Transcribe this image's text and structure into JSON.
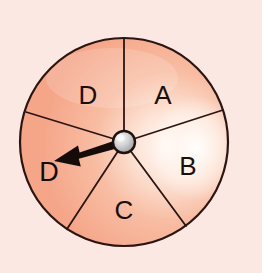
{
  "figure": {
    "kind": "spinner-wheel",
    "canvas": {
      "width": 262,
      "height": 273
    },
    "background_color": "#fbe8e2"
  },
  "wheel": {
    "center_x": 124,
    "center_y": 142,
    "radius": 104,
    "outline_color": "#2b1512",
    "outline_width": 2.2,
    "sector_fill": "#f7ae90",
    "sector_fill_light": "#fbd0bd",
    "highlight_color": "#fffaf6",
    "sector_count": 5,
    "spoke_color": "#2b1512",
    "spoke_width": 1.8,
    "sectors": [
      {
        "label": "A",
        "start_deg": -90,
        "end_deg": -18,
        "label_x": 163,
        "label_y": 97
      },
      {
        "label": "B",
        "start_deg": -18,
        "end_deg": 56,
        "label_x": 188,
        "label_y": 168
      },
      {
        "label": "C",
        "start_deg": 56,
        "end_deg": 124,
        "label_x": 124,
        "label_y": 212
      },
      {
        "label": "D",
        "start_deg": 124,
        "end_deg": 198,
        "label_x": 62,
        "label_y": 170
      },
      {
        "label": "D",
        "start_deg": 198,
        "end_deg": 270,
        "label_x": 88,
        "label_y": 97
      }
    ]
  },
  "hub": {
    "center_x": 124,
    "center_y": 142,
    "radius": 11,
    "fill": "#c9c9c9",
    "highlight": "#f2f2f2",
    "shadow": "#8d8d8d",
    "outline_color": "#1d1210",
    "outline_width": 2.4
  },
  "pointer": {
    "color": "#150c0a",
    "tail_x": 124,
    "tail_y": 142,
    "tip_x": 54,
    "tip_y": 161,
    "tail_half_width": 4.5,
    "head_length": 24,
    "head_half_width": 11,
    "points_to_label": "D",
    "points_to_sector_index": 3
  },
  "pointer_label": {
    "text": "D",
    "x": 49,
    "y": 174
  }
}
